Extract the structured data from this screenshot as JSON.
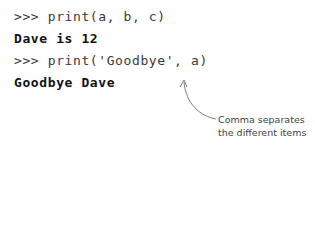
{
  "console": {
    "lines": [
      {
        "type": "input",
        "text": ">>> print(a, b, c)"
      },
      {
        "type": "output",
        "text": "Dave is 12"
      },
      {
        "type": "input",
        "text": ">>> print('Goodbye', a)"
      },
      {
        "type": "output",
        "text": "Goodbye Dave"
      }
    ]
  },
  "annotation": {
    "line1": "Comma separates",
    "line2": "the different items",
    "arrow_color": "#808080"
  }
}
